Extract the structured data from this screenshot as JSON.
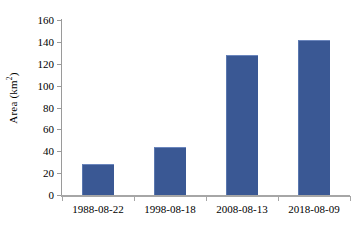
{
  "chart_data": {
    "type": "bar",
    "title": "",
    "xlabel": "",
    "ylabel": "Area (km2)",
    "ylabel_base": "Area (km",
    "ylabel_sup": "2",
    "ylabel_tail": ")",
    "categories": [
      "1988-08-22",
      "1998-08-18",
      "2008-08-13",
      "2018-08-09"
    ],
    "values": [
      28,
      44,
      128,
      142
    ],
    "ylim": [
      0,
      160
    ],
    "ytick_step": 20,
    "yticks": [
      0,
      20,
      40,
      60,
      80,
      100,
      120,
      140,
      160
    ],
    "ytick_labels": [
      "0",
      "20",
      "40",
      "60",
      "80",
      "100",
      "120",
      "140",
      "160"
    ],
    "grid": false,
    "legend": false,
    "legend_position": "none",
    "series": [
      {
        "name": "Area",
        "values": [
          28,
          44,
          128,
          142
        ],
        "color": "#3a5894"
      }
    ],
    "colors": {
      "bar_fill": "#3a5894",
      "bar_edge": "#6b86bd",
      "axis_line": "#a6a6a6",
      "text": "#000000",
      "background": "#ffffff"
    }
  }
}
